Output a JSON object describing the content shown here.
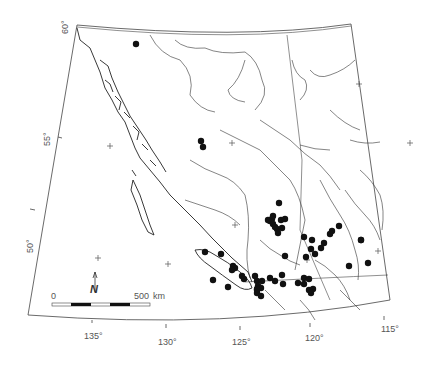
{
  "map": {
    "region": "British Columbia",
    "projection_frame": "conic graticule frame",
    "colors": {
      "background": "#ffffff",
      "lines": "#333333",
      "dots": "#111111",
      "labels": "#555555"
    },
    "latitude_labels": [
      {
        "text": "60°",
        "x": 62,
        "y": 30
      },
      {
        "text": "55°",
        "x": 43,
        "y": 144
      },
      {
        "text": "50°",
        "x": 26,
        "y": 250
      }
    ],
    "longitude_labels": [
      {
        "text": "135°",
        "x": 84,
        "y": 335
      },
      {
        "text": "130°",
        "x": 158,
        "y": 340
      },
      {
        "text": "125°",
        "x": 232,
        "y": 340
      },
      {
        "text": "120°",
        "x": 306,
        "y": 336
      },
      {
        "text": "115°",
        "x": 381,
        "y": 327
      }
    ],
    "scale_bar": {
      "start_label": "0",
      "end_label": "500",
      "unit": "km"
    },
    "north_arrow": {
      "label": "N"
    },
    "dots": [
      [
        136,
        44
      ],
      [
        201,
        141
      ],
      [
        203,
        147
      ],
      [
        279,
        203
      ],
      [
        273,
        216
      ],
      [
        272,
        219
      ],
      [
        273,
        224
      ],
      [
        275,
        227
      ],
      [
        270,
        221
      ],
      [
        268,
        220
      ],
      [
        281,
        220
      ],
      [
        277,
        229
      ],
      [
        282,
        228
      ],
      [
        278,
        233
      ],
      [
        285,
        219
      ],
      [
        304,
        237
      ],
      [
        312,
        240
      ],
      [
        311,
        249
      ],
      [
        315,
        254
      ],
      [
        321,
        248
      ],
      [
        324,
        243
      ],
      [
        339,
        226
      ],
      [
        330,
        234
      ],
      [
        332,
        231
      ],
      [
        361,
        240
      ],
      [
        361,
        240
      ],
      [
        285,
        256
      ],
      [
        221,
        254
      ],
      [
        233,
        266
      ],
      [
        235,
        268
      ],
      [
        242,
        276
      ],
      [
        244,
        279
      ],
      [
        255,
        276
      ],
      [
        257,
        281
      ],
      [
        262,
        281
      ],
      [
        258,
        286
      ],
      [
        261,
        288
      ],
      [
        270,
        278
      ],
      [
        275,
        281
      ],
      [
        282,
        275
      ],
      [
        306,
        257
      ],
      [
        298,
        283
      ],
      [
        304,
        278
      ],
      [
        309,
        279
      ],
      [
        304,
        284
      ],
      [
        309,
        290
      ],
      [
        313,
        289
      ],
      [
        311,
        293
      ],
      [
        349,
        266
      ],
      [
        368,
        263
      ],
      [
        205,
        252
      ],
      [
        213,
        280
      ],
      [
        232,
        270
      ],
      [
        257,
        290
      ],
      [
        257,
        293
      ],
      [
        261,
        296
      ],
      [
        228,
        287
      ],
      [
        257,
        289
      ],
      [
        283,
        284
      ]
    ],
    "graticule_crosses": [
      [
        110,
        146
      ],
      [
        359,
        84
      ],
      [
        98,
        258
      ],
      [
        168,
        264
      ],
      [
        235,
        225
      ],
      [
        307,
        260
      ],
      [
        378,
        251
      ],
      [
        410,
        143
      ],
      [
        232,
        143
      ]
    ]
  }
}
